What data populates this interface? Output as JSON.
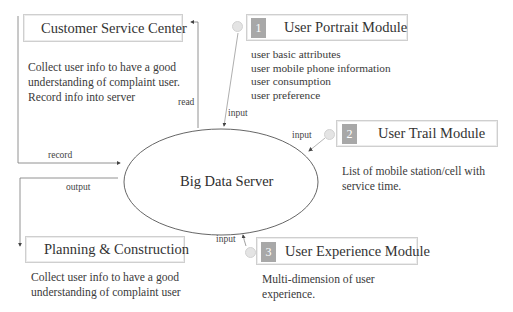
{
  "diagram": {
    "center": {
      "label": "Big Data Server"
    },
    "external_nodes": [
      {
        "id": "customer-service",
        "title": "Customer Service Center",
        "description": [
          "Collect user info to have a good",
          "understanding  of  complaint  user.",
          "Record info into server"
        ]
      },
      {
        "id": "planning",
        "title": "Planning & Construction",
        "description": [
          "Collect user info to have a good",
          "understanding  of  complaint  user"
        ]
      }
    ],
    "modules": [
      {
        "number": "1",
        "title": "User Portrait Module",
        "description": [
          "user  basic  attributes",
          "user  mobile  phone  information",
          "user  consumption",
          "user  preference"
        ]
      },
      {
        "number": "2",
        "title": "User Trail Module",
        "description": [
          "List of mobile station/cell with",
          "service  time."
        ]
      },
      {
        "number": "3",
        "title": "User Experience Module",
        "description": [
          "Multi-dimension  of  user",
          "experience."
        ]
      }
    ],
    "edges": {
      "read": "read",
      "record": "record",
      "output": "output",
      "input_1": "input",
      "input_2": "input",
      "input_3": "input"
    },
    "colors": {
      "line": "#555555",
      "box_border": "#cfcfcf",
      "badge": "#a8a8a8",
      "dot": "#e4e4e4"
    }
  }
}
